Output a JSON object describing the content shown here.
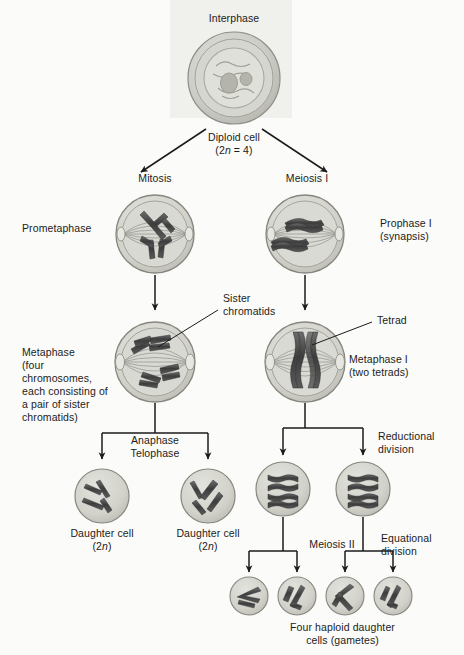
{
  "diagram": {
    "title_visible": false,
    "background_color": "#fbfbf9",
    "ink_color": "#1b1b1b",
    "cell_fill": "#c9c9c4",
    "cell_fill_light": "#dcdcd6",
    "chromosome_color": "#4a4a4a"
  },
  "labels": {
    "interphase": "Interphase",
    "diploid_cell": "Diploid cell",
    "diploid_count": "(2n = 4)",
    "diploid_count_prefix": "(2",
    "diploid_count_italic": "n",
    "diploid_count_suffix": " = 4)",
    "mitosis": "Mitosis",
    "meiosis_i": "Meiosis I",
    "prometaphase": "Prometaphase",
    "prophase_i_line1": "Prophase I",
    "prophase_i_line2": "(synapsis)",
    "sister_chromatids_line1": "Sister",
    "sister_chromatids_line2": "chromatids",
    "tetrad": "Tetrad",
    "metaphase_block_line1": "Metaphase",
    "metaphase_block_line2": "(four",
    "metaphase_block_line3": "chromosomes,",
    "metaphase_block_line4": "each consisting of",
    "metaphase_block_line5": "a pair of sister",
    "metaphase_block_line6": "chromatids)",
    "metaphase_i_line1": "Metaphase I",
    "metaphase_i_line2": "(two tetrads)",
    "anaphase": "Anaphase",
    "telophase": "Telophase",
    "reductional_line1": "Reductional",
    "reductional_line2": "division",
    "equational_line1": "Equational",
    "equational_line2": "division",
    "meiosis_ii": "Meiosis II",
    "daughter_cell": "Daughter cell",
    "daughter_2n_prefix": "(2",
    "daughter_2n_italic": "n",
    "daughter_2n_suffix": ")",
    "four_haploid_line1": "Four haploid daughter",
    "four_haploid_line2": "cells (gametes)"
  },
  "cells": [
    {
      "id": "interphase",
      "name": "interphase-cell",
      "stage": "Interphase",
      "ploidy": "2n = 4"
    },
    {
      "id": "prometaphase",
      "name": "prometaphase-cell",
      "stage": "Prometaphase",
      "ploidy": "2n"
    },
    {
      "id": "prophase-i",
      "name": "prophase-i-cell",
      "stage": "Prophase I (synapsis)",
      "ploidy": "2n"
    },
    {
      "id": "metaphase",
      "name": "metaphase-cell",
      "stage": "Metaphase",
      "ploidy": "2n"
    },
    {
      "id": "metaphase-i",
      "name": "metaphase-i-cell",
      "stage": "Metaphase I (two tetrads)",
      "ploidy": "2n"
    },
    {
      "id": "daughter-1",
      "name": "daughter-cell-1",
      "stage": "Daughter cell",
      "ploidy": "2n"
    },
    {
      "id": "daughter-2",
      "name": "daughter-cell-2",
      "stage": "Daughter cell",
      "ploidy": "2n"
    },
    {
      "id": "meiosis-ii-a",
      "name": "meiosis-ii-cell-a",
      "stage": "Meiosis II",
      "ploidy": "n"
    },
    {
      "id": "meiosis-ii-b",
      "name": "meiosis-ii-cell-b",
      "stage": "Meiosis II",
      "ploidy": "n"
    },
    {
      "id": "gamete-1",
      "name": "gamete-cell-1",
      "stage": "Gamete",
      "ploidy": "n"
    },
    {
      "id": "gamete-2",
      "name": "gamete-cell-2",
      "stage": "Gamete",
      "ploidy": "n"
    },
    {
      "id": "gamete-3",
      "name": "gamete-cell-3",
      "stage": "Gamete",
      "ploidy": "n"
    },
    {
      "id": "gamete-4",
      "name": "gamete-cell-4",
      "stage": "Gamete",
      "ploidy": "n"
    }
  ]
}
